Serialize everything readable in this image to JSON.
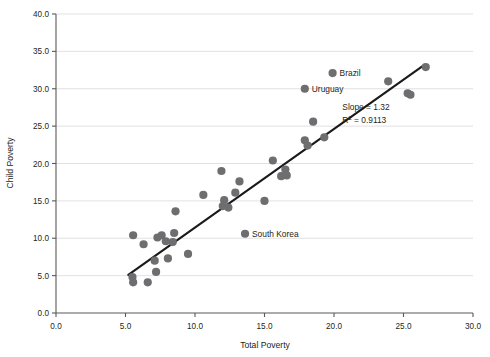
{
  "chart_data": {
    "type": "scatter",
    "title": "",
    "xlabel": "Total Poverty",
    "ylabel": "Child Poverty",
    "xlim": [
      0.0,
      30.0
    ],
    "ylim": [
      0.0,
      40.0
    ],
    "xticks": [
      "0.0",
      "5.0",
      "10.0",
      "15.0",
      "20.0",
      "25.0",
      "30.0"
    ],
    "yticks": [
      "0.0",
      "5.0",
      "10.0",
      "15.0",
      "20.0",
      "25.0",
      "30.0",
      "35.0",
      "40.0"
    ],
    "grid": "horizontal",
    "legend": "none",
    "marker_color": "#6e6e70",
    "fit_line_color": "#1a1a1a",
    "annotations": [
      {
        "name": "slope",
        "text": "Slope = 1.32",
        "x": 20.6,
        "y": 27.2
      },
      {
        "name": "r-squared",
        "text": "R",
        "sup": "2",
        "rest": " = 0.9113",
        "x": 20.6,
        "y": 25.4
      }
    ],
    "fit_line": {
      "slope": 1.32,
      "r_squared": 0.9113,
      "x0": 5.2,
      "y0": 5.1,
      "x1": 26.5,
      "y1": 33.2
    },
    "labeled_points": [
      {
        "label": "Brazil",
        "x": 19.9,
        "y": 32.1
      },
      {
        "label": "Uruguay",
        "x": 17.9,
        "y": 30.0
      },
      {
        "label": "South Korea",
        "x": 13.6,
        "y": 10.6
      }
    ],
    "points": [
      {
        "x": 5.55,
        "y": 10.4
      },
      {
        "x": 5.5,
        "y": 4.8
      },
      {
        "x": 5.55,
        "y": 4.1
      },
      {
        "x": 6.3,
        "y": 9.2
      },
      {
        "x": 6.6,
        "y": 4.1
      },
      {
        "x": 7.1,
        "y": 7.0
      },
      {
        "x": 7.2,
        "y": 5.5
      },
      {
        "x": 7.3,
        "y": 10.1
      },
      {
        "x": 7.6,
        "y": 10.4
      },
      {
        "x": 7.9,
        "y": 9.6
      },
      {
        "x": 8.05,
        "y": 7.3
      },
      {
        "x": 8.4,
        "y": 9.5
      },
      {
        "x": 8.5,
        "y": 10.7
      },
      {
        "x": 8.6,
        "y": 13.6
      },
      {
        "x": 9.5,
        "y": 7.9
      },
      {
        "x": 10.6,
        "y": 15.8
      },
      {
        "x": 11.9,
        "y": 19.0
      },
      {
        "x": 12.0,
        "y": 14.3
      },
      {
        "x": 12.1,
        "y": 15.1
      },
      {
        "x": 12.4,
        "y": 14.1
      },
      {
        "x": 12.9,
        "y": 16.1
      },
      {
        "x": 13.2,
        "y": 17.6
      },
      {
        "x": 13.6,
        "y": 10.6
      },
      {
        "x": 15.0,
        "y": 15.0
      },
      {
        "x": 15.6,
        "y": 20.4
      },
      {
        "x": 16.2,
        "y": 18.3
      },
      {
        "x": 16.5,
        "y": 19.2
      },
      {
        "x": 16.6,
        "y": 18.4
      },
      {
        "x": 17.9,
        "y": 30.0
      },
      {
        "x": 17.9,
        "y": 23.1
      },
      {
        "x": 18.1,
        "y": 22.4
      },
      {
        "x": 18.5,
        "y": 25.6
      },
      {
        "x": 19.3,
        "y": 23.5
      },
      {
        "x": 19.9,
        "y": 32.1
      },
      {
        "x": 23.9,
        "y": 31.0
      },
      {
        "x": 25.3,
        "y": 29.4
      },
      {
        "x": 25.5,
        "y": 29.2
      },
      {
        "x": 26.6,
        "y": 32.9
      }
    ]
  }
}
